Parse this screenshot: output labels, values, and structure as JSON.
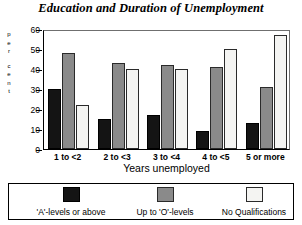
{
  "chart_data": {
    "type": "bar",
    "title": "Education and Duration of Unemployment",
    "xlabel": "Years unemployed",
    "ylabel": "per cent",
    "ylabel_letters": [
      "p",
      "e",
      "r",
      "c",
      "e",
      "n",
      "t"
    ],
    "categories": [
      "1 to <2",
      "2 to <3",
      "3 to <4",
      "4 to <5",
      "5 or more"
    ],
    "yticks": [
      0,
      10,
      20,
      30,
      40,
      50,
      60
    ],
    "ylim": [
      0,
      60
    ],
    "grid": false,
    "legend_position": "bottom",
    "series": [
      {
        "name": "'A'-levels or above",
        "color": "#141414",
        "values": [
          30,
          15,
          17,
          9,
          13
        ]
      },
      {
        "name": "Up to 'O'-levels",
        "color": "#8a8a8a",
        "values": [
          48,
          43,
          42,
          41,
          31
        ]
      },
      {
        "name": "No Qualifications",
        "color": "#f4f4f2",
        "values": [
          22,
          40,
          40,
          50,
          57
        ]
      }
    ]
  }
}
